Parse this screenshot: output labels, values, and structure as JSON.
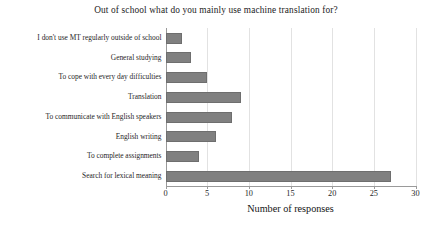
{
  "chart_data": {
    "type": "bar",
    "orientation": "horizontal",
    "title": "Out of school what do you mainly use machine translation for?",
    "xlabel": "Number of responses",
    "ylabel": "",
    "xlim": [
      0,
      30
    ],
    "xticks": [
      0,
      5,
      10,
      15,
      20,
      25,
      30
    ],
    "xtick_labels": [
      "0",
      "5",
      "10",
      "15",
      "20",
      "25",
      "30"
    ],
    "grid": true,
    "grid_axis": "x",
    "legend": false,
    "categories": [
      "I don't use MT regularly outside of school",
      "General studying",
      "To cope with every day difficulties",
      "Translation",
      "To communicate with English speakers",
      "English writing",
      "To complete assignments",
      "Search for lexical meaning"
    ],
    "values": [
      2,
      3,
      5,
      9,
      8,
      6,
      4,
      27
    ],
    "bar_color": "#808080",
    "bar_edge_color": "#6e6e6e",
    "grid_color": "#e2e2e2",
    "axis_color": "#9a9a9a",
    "background_color": "#ffffff",
    "text_color": "#1f1f1f"
  }
}
